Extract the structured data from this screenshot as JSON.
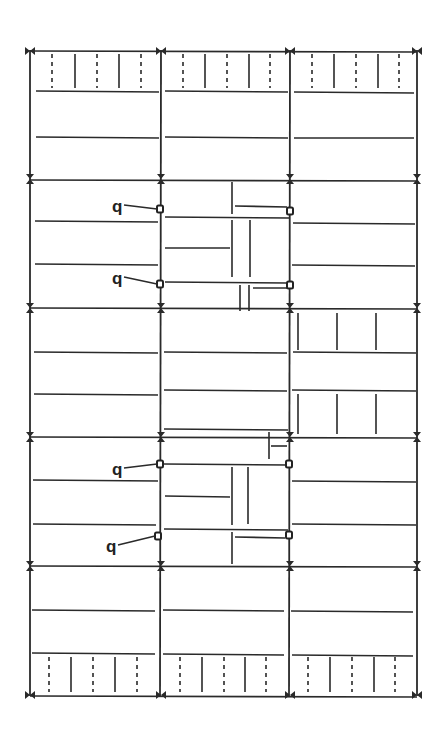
{
  "drawing": {
    "type": "structural framing plan",
    "colors": {
      "line": "#2a2a2a",
      "background": "#ffffff"
    },
    "column_lines_x": [
      30,
      161,
      290,
      417
    ],
    "girder_lines_y": [
      51,
      179,
      308,
      437,
      566,
      695
    ],
    "labels": [
      {
        "text": "q",
        "x": 112,
        "y": 212,
        "target": [
          160,
          209
        ]
      },
      {
        "text": "q",
        "x": 112,
        "y": 284,
        "target": [
          160,
          284
        ]
      },
      {
        "text": "q",
        "x": 112,
        "y": 475,
        "target": [
          160,
          464
        ]
      },
      {
        "text": "q",
        "x": 106,
        "y": 552,
        "target": [
          158,
          536
        ]
      }
    ],
    "pin_connections": [
      [
        160,
        209
      ],
      [
        290,
        211
      ],
      [
        160,
        284
      ],
      [
        290,
        285
      ],
      [
        160,
        464
      ],
      [
        289,
        464
      ],
      [
        158,
        536
      ],
      [
        289,
        535
      ]
    ]
  }
}
